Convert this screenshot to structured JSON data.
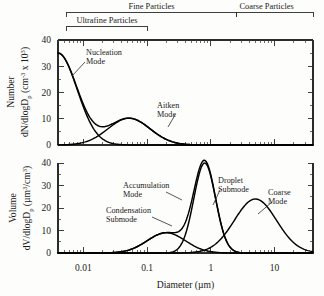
{
  "figure": {
    "background": "#fdfdfc",
    "ink": "#1a1a1a"
  },
  "brackets": [
    {
      "id": "fine",
      "label": "Fine Particles",
      "from": 0.0055,
      "to": 2.5,
      "row": 0
    },
    {
      "id": "coarse",
      "label": "Coarse Particles",
      "from": 2.5,
      "to": 40,
      "row": 0
    },
    {
      "id": "ultrafine",
      "label": "Ultrafine Particles",
      "from": 0.0055,
      "to": 0.1,
      "row": 1
    }
  ],
  "xaxis": {
    "title": "Diameter (µm)",
    "min": 0.004,
    "max": 40,
    "decades": [
      {
        "value": 0.01,
        "label": "0.01"
      },
      {
        "value": 0.1,
        "label": "0.1"
      },
      {
        "value": 1,
        "label": "1"
      },
      {
        "value": 10,
        "label": "10"
      }
    ]
  },
  "panels": [
    {
      "id": "number",
      "ylabel_line1": "Number",
      "ylabel_line2": "dN/dlogD",
      "ylabel_sub": "p",
      "ylabel_units": " (cm",
      "ylabel_exp": "-3",
      "ylabel_tail": " x 10",
      "ylabel_exp2": "3",
      "ylabel_close": ")",
      "yticks": [
        0,
        10,
        20,
        30,
        40
      ],
      "ymin": 0,
      "ymax": 44,
      "labels": [
        {
          "id": "nucleation",
          "line1": "Nucleation",
          "line2": "Mode"
        },
        {
          "id": "aitken",
          "line1": "Aitken",
          "line2": "Mode"
        }
      ],
      "curves": [
        {
          "id": "nucleation-mode",
          "peak_diameter": 0.004,
          "peak_value": 35,
          "sigma": 0.3
        },
        {
          "id": "aitken-mode",
          "peak_diameter": 0.052,
          "peak_value": 10.2,
          "sigma": 0.33
        },
        {
          "id": "number-total",
          "peak_diameter": 0.004,
          "peak_value": 35,
          "sigma": 0.3
        }
      ]
    },
    {
      "id": "volume",
      "ylabel_line1": "Volume",
      "ylabel_line2": "dV/dlogD",
      "ylabel_sub": "p",
      "ylabel_units": " (µm",
      "ylabel_exp": "3",
      "ylabel_tail": "/cm",
      "ylabel_exp2": "3",
      "ylabel_close": ")",
      "yticks": [
        0,
        10,
        20,
        30,
        40
      ],
      "ymin": 0,
      "ymax": 48,
      "labels": [
        {
          "id": "accumulation",
          "line1": "Accumulation",
          "line2": "Mode"
        },
        {
          "id": "condensation",
          "line1": "Condensation",
          "line2": "Submode"
        },
        {
          "id": "droplet",
          "line1": "Droplet",
          "line2": "Submode"
        },
        {
          "id": "coarse",
          "line1": "Coarse",
          "line2": "Mode"
        }
      ],
      "curves": [
        {
          "id": "condensation-submode",
          "peak_diameter": 0.2,
          "peak_value": 9,
          "sigma": 0.3
        },
        {
          "id": "droplet-submode",
          "peak_diameter": 0.8,
          "peak_value": 40,
          "sigma": 0.17
        },
        {
          "id": "coarse-mode",
          "peak_diameter": 5.0,
          "peak_value": 24,
          "sigma": 0.33
        },
        {
          "id": "accumulation-envelope",
          "peak_diameter": 0.75,
          "peak_value": 45,
          "sigma": 0.22
        }
      ]
    }
  ],
  "chart_data": {
    "type": "line",
    "xlabel": "Diameter (µm)",
    "xscale": "log",
    "xlim": [
      0.004,
      40
    ],
    "xticks": [
      0.01,
      0.1,
      1,
      10
    ],
    "xticklabels": [
      "0.01",
      "0.1",
      "1",
      "10"
    ],
    "grid": false,
    "legend": "none (inline annotations)",
    "panels": [
      {
        "name": "Number distribution",
        "ylabel": "Number dN/dlogDp (cm^-3 x 10^3)",
        "ylim": [
          0,
          44
        ],
        "yticks": [
          0,
          10,
          20,
          30,
          40
        ],
        "series": [
          {
            "name": "Nucleation Mode",
            "mode_diameter_um": 0.004,
            "peak_value": 35,
            "log_sigma": 0.3,
            "note": "decays steeply from left edge"
          },
          {
            "name": "Aitken Mode",
            "mode_diameter_um": 0.052,
            "peak_value": 10.2,
            "log_sigma": 0.33
          }
        ],
        "annotations": [
          "Nucleation Mode",
          "Aitken Mode"
        ]
      },
      {
        "name": "Volume distribution",
        "ylabel": "Volume dV/dlogDp (um^3/cm^3)",
        "ylim": [
          0,
          48
        ],
        "yticks": [
          0,
          10,
          20,
          30,
          40
        ],
        "series": [
          {
            "name": "Condensation Submode",
            "mode_diameter_um": 0.2,
            "peak_value": 9,
            "log_sigma": 0.3
          },
          {
            "name": "Droplet Submode",
            "mode_diameter_um": 0.8,
            "peak_value": 40,
            "log_sigma": 0.17
          },
          {
            "name": "Accumulation Mode",
            "mode_diameter_um": 0.75,
            "peak_value": 45,
            "log_sigma": 0.22,
            "note": "envelope of condensation + droplet submodes"
          },
          {
            "name": "Coarse Mode",
            "mode_diameter_um": 5.0,
            "peak_value": 24,
            "log_sigma": 0.33
          }
        ],
        "annotations": [
          "Accumulation Mode",
          "Condensation Submode",
          "Droplet Submode",
          "Coarse Mode"
        ]
      }
    ],
    "size_ranges": [
      {
        "name": "Ultrafine Particles",
        "from_um": 0.0055,
        "to_um": 0.1
      },
      {
        "name": "Fine Particles",
        "from_um": 0.0055,
        "to_um": 2.5
      },
      {
        "name": "Coarse Particles",
        "from_um": 2.5,
        "to_um": 40
      }
    ]
  }
}
